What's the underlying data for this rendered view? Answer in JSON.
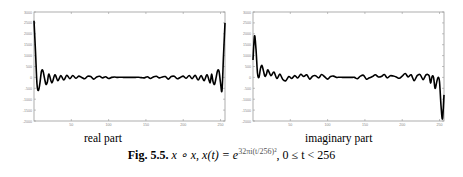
{
  "figure": {
    "caption_label": "Fig. 5.5.",
    "caption_text": "x ∘ x, x(t) = e",
    "caption_exponent": "32πi(t/256)²",
    "caption_tail": ", 0 ≤ t < 256",
    "subcaptions": [
      "real part",
      "imaginary part"
    ]
  },
  "chart_data": [
    {
      "type": "line",
      "title": "real part",
      "xlabel": "",
      "ylabel": "",
      "xlim": [
        0,
        256
      ],
      "ylim": [
        -2000,
        3000
      ],
      "xticks": [
        50,
        100,
        150,
        200,
        250
      ],
      "yticks": [
        3000,
        2500,
        2000,
        1500,
        1000,
        500,
        0,
        -500,
        -1000,
        -1500,
        -2000
      ],
      "grid": false,
      "x": [
        0,
        2,
        4,
        6,
        8,
        10,
        12,
        14,
        16,
        18,
        20,
        24,
        28,
        32,
        36,
        40,
        44,
        48,
        52,
        56,
        60,
        64,
        68,
        72,
        76,
        80,
        84,
        88,
        92,
        96,
        100,
        104,
        108,
        112,
        116,
        120,
        124,
        128,
        132,
        136,
        140,
        144,
        148,
        152,
        156,
        160,
        164,
        168,
        172,
        176,
        180,
        184,
        188,
        192,
        196,
        200,
        204,
        208,
        212,
        216,
        220,
        224,
        228,
        232,
        236,
        238,
        240,
        242,
        244,
        246,
        248,
        250,
        252,
        254,
        256
      ],
      "values": [
        2600,
        1200,
        -300,
        -600,
        -250,
        280,
        300,
        -20,
        -320,
        -200,
        150,
        -250,
        120,
        -150,
        80,
        -120,
        100,
        -60,
        90,
        -40,
        60,
        0,
        -60,
        50,
        40,
        -80,
        20,
        50,
        -20,
        30,
        -50,
        0,
        20,
        0,
        10,
        0,
        0,
        0,
        0,
        0,
        10,
        -10,
        -20,
        30,
        -50,
        20,
        50,
        -20,
        20,
        40,
        -80,
        40,
        50,
        -60,
        0,
        60,
        -40,
        90,
        -60,
        100,
        -120,
        80,
        -150,
        120,
        -250,
        150,
        -200,
        -320,
        -20,
        300,
        280,
        -250,
        -600,
        1000,
        2500
      ]
    },
    {
      "type": "line",
      "title": "imaginary part",
      "xlabel": "",
      "ylabel": "",
      "xlim": [
        0,
        256
      ],
      "ylim": [
        -2000,
        3000
      ],
      "xticks": [
        50,
        100,
        150,
        200,
        250
      ],
      "yticks": [
        3000,
        2500,
        2000,
        1500,
        1000,
        500,
        0,
        -500,
        -1000,
        -1500,
        -2000
      ],
      "grid": false,
      "x": [
        0,
        2,
        4,
        6,
        8,
        10,
        12,
        14,
        16,
        18,
        20,
        24,
        28,
        32,
        36,
        40,
        44,
        48,
        52,
        56,
        60,
        64,
        68,
        72,
        76,
        80,
        84,
        88,
        92,
        96,
        100,
        104,
        108,
        112,
        116,
        120,
        124,
        128,
        132,
        136,
        140,
        144,
        148,
        152,
        156,
        160,
        164,
        168,
        172,
        176,
        180,
        184,
        188,
        192,
        196,
        200,
        204,
        208,
        212,
        216,
        220,
        224,
        228,
        232,
        236,
        238,
        240,
        242,
        244,
        246,
        248,
        250,
        252,
        254,
        256
      ],
      "values": [
        800,
        1900,
        1300,
        200,
        0,
        400,
        550,
        300,
        50,
        150,
        350,
        80,
        250,
        -50,
        150,
        -100,
        -150,
        40,
        -50,
        80,
        -30,
        140,
        40,
        120,
        -80,
        60,
        80,
        -20,
        130,
        30,
        -80,
        40,
        60,
        0,
        10,
        0,
        0,
        0,
        0,
        0,
        -60,
        60,
        100,
        -80,
        -20,
        40,
        120,
        20,
        40,
        130,
        -20,
        80,
        60,
        20,
        -40,
        60,
        180,
        20,
        120,
        -150,
        80,
        130,
        -100,
        120,
        80,
        -260,
        40,
        0,
        -500,
        -250,
        0,
        -200,
        -1300,
        -1900,
        -800
      ]
    }
  ]
}
